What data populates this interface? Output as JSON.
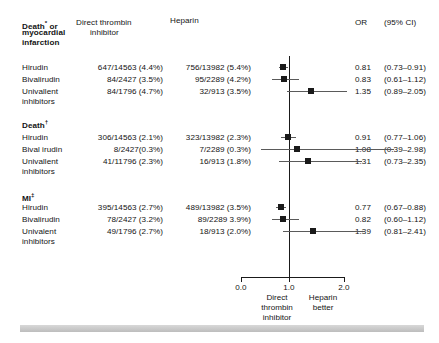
{
  "figure": {
    "type": "forest-plot",
    "headers": {
      "outcome": "Death* or\nmyocardial\ninfarction",
      "outcome_line1": "Death",
      "outcome_sup1": "*",
      "outcome_line1b": " or",
      "outcome_line2": "myocardial",
      "outcome_line3": "infarction",
      "dti_line1": "Direct thrombin",
      "dti_line2": "inhibitor",
      "heparin": "Heparin",
      "or": "OR",
      "ci": "(95% CI)"
    },
    "axis": {
      "ticks": [
        "0.0",
        "1.0",
        "2.0"
      ],
      "tick_values": [
        0.0,
        1.0,
        2.0
      ],
      "null_value": 1.0,
      "left_caption": "Direct\nthrombin\ninhibitor",
      "left_caption_l1": "Direct",
      "left_caption_l2": "thrombin",
      "left_caption_l3": "inhibitor",
      "right_caption": "Heparin\nbetter",
      "right_caption_l1": "Heparin",
      "right_caption_l2": "better"
    },
    "groups": [
      {
        "id": "death-or-mi",
        "title_main": "Death",
        "title_sup": "*",
        "title_tail": " or",
        "title_l2": "myocardial",
        "title_l3": "infarction",
        "rows": [
          {
            "label": "Hirudin",
            "label2": "",
            "dti": "647/14563 (4.4%)",
            "heparin": "756/13982 (5.4%)",
            "or": "0.81",
            "ci": "(0.73–0.91)",
            "or_value": 0.81,
            "ci_low": 0.73,
            "ci_high": 0.91
          },
          {
            "label": "Bivalirudin",
            "label2": "",
            "dti": "84/2427 (3.5%)",
            "heparin": "95/2289 (4.2%)",
            "or": "0.83",
            "ci": "(0.61–1.12)",
            "or_value": 0.83,
            "ci_low": 0.61,
            "ci_high": 1.12
          },
          {
            "label": "Univallent",
            "label2": "inhibitors",
            "dti": "84/1796 (4.7%)",
            "heparin": "32/913 (3.5%)",
            "or": "1.35",
            "ci": "(0.89–2.05)",
            "or_value": 1.35,
            "ci_low": 0.89,
            "ci_high": 2.05
          }
        ]
      },
      {
        "id": "death",
        "title_main": "Death",
        "title_sup": "†",
        "title_tail": "",
        "title_l2": "",
        "title_l3": "",
        "rows": [
          {
            "label": "Hirudin",
            "label2": "",
            "dti": "306/14563 (2.1%)",
            "heparin": "323/13982 (2.3%)",
            "or": "0.91",
            "ci": "(0.77–1.06)",
            "or_value": 0.91,
            "ci_low": 0.77,
            "ci_high": 1.06
          },
          {
            "label": "Bival irudin",
            "label2": "",
            "dti": "8/2427(0.3%)",
            "heparin": "7/2289 (0.3%)",
            "or": "1.08",
            "ci": "(0.39–2.98)",
            "or_value": 1.08,
            "ci_low": 0.39,
            "ci_high": 2.98
          },
          {
            "label": "Univallent",
            "label2": "inhibitors",
            "dti": "41/11796 (2.3%)",
            "heparin": "16/913 (1.8%)",
            "or": "1.31",
            "ci": "(0.73–2.35)",
            "or_value": 1.31,
            "ci_low": 0.73,
            "ci_high": 2.35
          }
        ]
      },
      {
        "id": "mi",
        "title_main": "MI",
        "title_sup": "‡",
        "title_tail": "",
        "title_l2": "",
        "title_l3": "",
        "rows": [
          {
            "label": "Hirudin",
            "label2": "",
            "dti": "395/14563 (2.7%)",
            "heparin": "489/13982 (3.5%)",
            "or": "0.77",
            "ci": "(0.67–0.88)",
            "or_value": 0.77,
            "ci_low": 0.67,
            "ci_high": 0.88
          },
          {
            "label": "Bivalirudin",
            "label2": "",
            "dti": "78/2427 (3.2%)",
            "heparin": "89/2289 3.9%)",
            "or": "0.82",
            "ci": "(0.60–1.12)",
            "or_value": 0.82,
            "ci_low": 0.6,
            "ci_high": 1.12
          },
          {
            "label": "Univalent",
            "label2": "inhibitors",
            "dti": "49/1796 (2.7%)",
            "heparin": "18/913 (2.0%)",
            "or": "1.39",
            "ci": "(0.81–2.41)",
            "or_value": 1.39,
            "ci_low": 0.81,
            "ci_high": 2.41
          }
        ]
      }
    ]
  },
  "chart_data": {
    "type": "forest",
    "title": "",
    "xlabel": "Odds ratio",
    "ylabel": "",
    "xlim": [
      0.0,
      2.0
    ],
    "xticks": [
      0.0,
      1.0,
      2.0
    ],
    "reference_line": 1.0,
    "grid": false,
    "legend": "none",
    "left_favors": "Direct thrombin inhibitor",
    "right_favors": "Heparin better",
    "series": [
      {
        "name": "Death* or myocardial infarction",
        "points": [
          {
            "label": "Hirudin",
            "or": 0.81,
            "ci_low": 0.73,
            "ci_high": 0.91,
            "dti_events": 647,
            "dti_total": 14563,
            "dti_pct": 4.4,
            "hep_events": 756,
            "hep_total": 13982,
            "hep_pct": 5.4
          },
          {
            "label": "Bivalirudin",
            "or": 0.83,
            "ci_low": 0.61,
            "ci_high": 1.12,
            "dti_events": 84,
            "dti_total": 2427,
            "dti_pct": 3.5,
            "hep_events": 95,
            "hep_total": 2289,
            "hep_pct": 4.2
          },
          {
            "label": "Univallent inhibitors",
            "or": 1.35,
            "ci_low": 0.89,
            "ci_high": 2.05,
            "dti_events": 84,
            "dti_total": 1796,
            "dti_pct": 4.7,
            "hep_events": 32,
            "hep_total": 913,
            "hep_pct": 3.5
          }
        ]
      },
      {
        "name": "Death†",
        "points": [
          {
            "label": "Hirudin",
            "or": 0.91,
            "ci_low": 0.77,
            "ci_high": 1.06,
            "dti_events": 306,
            "dti_total": 14563,
            "dti_pct": 2.1,
            "hep_events": 323,
            "hep_total": 13982,
            "hep_pct": 2.3
          },
          {
            "label": "Bival irudin",
            "or": 1.08,
            "ci_low": 0.39,
            "ci_high": 2.98,
            "dti_events": 8,
            "dti_total": 2427,
            "dti_pct": 0.3,
            "hep_events": 7,
            "hep_total": 2289,
            "hep_pct": 0.3
          },
          {
            "label": "Univallent inhibitors",
            "or": 1.31,
            "ci_low": 0.73,
            "ci_high": 2.35,
            "dti_events": 41,
            "dti_total": 11796,
            "dti_pct": 2.3,
            "hep_events": 16,
            "hep_total": 913,
            "hep_pct": 1.8
          }
        ]
      },
      {
        "name": "MI‡",
        "points": [
          {
            "label": "Hirudin",
            "or": 0.77,
            "ci_low": 0.67,
            "ci_high": 0.88,
            "dti_events": 395,
            "dti_total": 14563,
            "dti_pct": 2.7,
            "hep_events": 489,
            "hep_total": 13982,
            "hep_pct": 3.5
          },
          {
            "label": "Bivalirudin",
            "or": 0.82,
            "ci_low": 0.6,
            "ci_high": 1.12,
            "dti_events": 78,
            "dti_total": 2427,
            "dti_pct": 3.2,
            "hep_events": 89,
            "hep_total": 2289,
            "hep_pct": 3.9
          },
          {
            "label": "Univalent inhibitors",
            "or": 1.39,
            "ci_low": 0.81,
            "ci_high": 2.41,
            "dti_events": 49,
            "dti_total": 1796,
            "dti_pct": 2.7,
            "hep_events": 18,
            "hep_total": 913,
            "hep_pct": 2.0
          }
        ]
      }
    ]
  }
}
